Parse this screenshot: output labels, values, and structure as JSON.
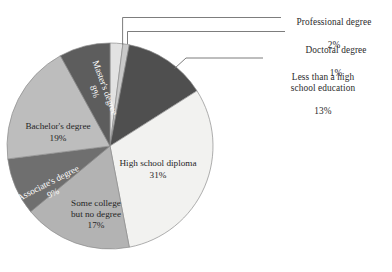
{
  "chart_data": {
    "type": "pie",
    "title": "",
    "subtitle": "",
    "xlabel": "",
    "ylabel": "",
    "legend_position": "none",
    "grid": false,
    "units": "percent",
    "start_angle_deg": 0,
    "direction": "clockwise",
    "categories": [
      "Professional degree",
      "Doctoral degree",
      "Less than a high school education",
      "High school diploma",
      "Some college but no degree",
      "Associate's degree",
      "Bachelor's degree",
      "Master's degree"
    ],
    "values": [
      2,
      1,
      13,
      31,
      17,
      9,
      19,
      8
    ],
    "value_labels": [
      "2%",
      "1%",
      "13%",
      "31%",
      "17%",
      "9%",
      "19%",
      "8%"
    ],
    "slices": [
      {
        "name": "Professional degree",
        "label_lines": [
          "Professional degree"
        ],
        "value": 2,
        "value_label": "2%",
        "color": "#e2e2e2",
        "label_placement": "outside",
        "text_color": "#2b2b2b"
      },
      {
        "name": "Doctoral degree",
        "label_lines": [
          "Doctoral degree"
        ],
        "value": 1,
        "value_label": "1%",
        "color": "#c9c9c9",
        "label_placement": "outside",
        "text_color": "#2b2b2b"
      },
      {
        "name": "Less than a high school education",
        "label_lines": [
          "Less than a high",
          "school education"
        ],
        "value": 13,
        "value_label": "13%",
        "color": "#4f4f4f",
        "label_placement": "outside",
        "text_color": "#2b2b2b"
      },
      {
        "name": "High school diploma",
        "label_lines": [
          "High school diploma"
        ],
        "value": 31,
        "value_label": "31%",
        "color": "#f2f2f0",
        "label_placement": "inside",
        "text_color": "#262626"
      },
      {
        "name": "Some college but no degree",
        "label_lines": [
          "Some college",
          "but no degree"
        ],
        "value": 17,
        "value_label": "17%",
        "color": "#b3b3b3",
        "label_placement": "inside",
        "text_color": "#262626"
      },
      {
        "name": "Associate's degree",
        "label_lines": [
          "Associate's degree"
        ],
        "value": 9,
        "value_label": "9%",
        "color": "#6f6f6f",
        "label_placement": "inside",
        "text_color": "#ffffff"
      },
      {
        "name": "Bachelor's degree",
        "label_lines": [
          "Bachelor's degree"
        ],
        "value": 19,
        "value_label": "19%",
        "color": "#bdbdbd",
        "label_placement": "inside",
        "text_color": "#262626"
      },
      {
        "name": "Master's degree",
        "label_lines": [
          "Master's degree"
        ],
        "value": 8,
        "value_label": "8%",
        "color": "#5d5d5d",
        "label_placement": "inside",
        "text_color": "#ffffff"
      }
    ]
  },
  "geometry": {
    "center_x": 110,
    "center_y": 146,
    "radius": 103,
    "stroke_color": "#8c8c8c",
    "leader_color": "#6e6e6e"
  },
  "callouts": [
    {
      "key": "professional",
      "name": "Professional degree",
      "pct": "2%",
      "text_left": 284,
      "text_top": 8
    },
    {
      "key": "doctoral",
      "name": "Doctoral degree",
      "pct": "1%",
      "text_left": 288,
      "text_top": 36
    },
    {
      "key": "lessthanhs",
      "name": "Less than a high\nschool education",
      "pct": "13%",
      "text_left": 268,
      "text_top": 63
    }
  ],
  "inner_labels": [
    {
      "key": "high-school-diploma",
      "line1": "High school diploma",
      "line2": "31%",
      "x": 158,
      "y": 170,
      "rotate": 0,
      "light": false
    },
    {
      "key": "some-college",
      "line1": "Some college",
      "line2": "but no degree",
      "line3": "17%",
      "x": 96,
      "y": 215,
      "rotate": 0,
      "light": false
    },
    {
      "key": "associates-degree",
      "line1": "Associate's degree",
      "line2": "9%",
      "x": 51,
      "y": 189,
      "rotate": -27,
      "light": true
    },
    {
      "key": "bachelors-degree",
      "line1": "Bachelor's degree",
      "line2": "19%",
      "x": 58,
      "y": 133,
      "rotate": 0,
      "light": false
    },
    {
      "key": "masters-degree",
      "line1": "Master's degree",
      "line2": "8%",
      "x": 99,
      "y": 90,
      "rotate": 70,
      "light": true
    }
  ]
}
